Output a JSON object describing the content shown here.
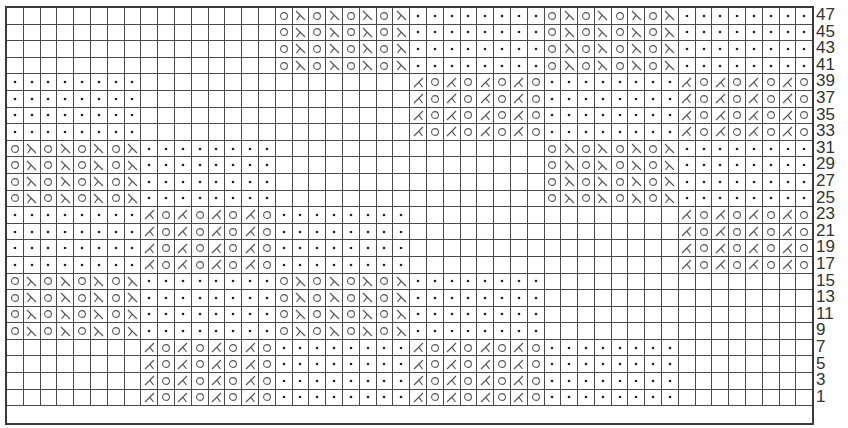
{
  "chart_title": "",
  "grid": {
    "columns": 48,
    "rows": 24,
    "block_width": 8,
    "colors": {
      "line": "#4a4a4a",
      "symbol": "#555555",
      "dot": "#222222",
      "background": "#ffffff",
      "label": "#333333"
    }
  },
  "symbols": {
    "blank": "knit (empty square)",
    "dot": "purl",
    "yo": "yarn over (circle)",
    "ssk": "left-leaning decrease",
    "k2tog": "right-leaning decrease"
  },
  "block_patterns": {
    "OS": [
      "yo",
      "ssk",
      "yo",
      "ssk",
      "yo",
      "ssk",
      "yo",
      "ssk"
    ],
    "KO": [
      "k2tog",
      "yo",
      "k2tog",
      "yo",
      "k2tog",
      "yo",
      "k2tog",
      "yo"
    ],
    "P": [
      "dot",
      "dot",
      "dot",
      "dot",
      "dot",
      "dot",
      "dot",
      "dot"
    ],
    "B": [
      "blank",
      "blank",
      "blank",
      "blank",
      "blank",
      "blank",
      "blank",
      "blank"
    ]
  },
  "bands": [
    {
      "rows": [
        "47",
        "45",
        "43",
        "41"
      ],
      "blocks": [
        "B",
        "B",
        "OS",
        "P",
        "OS",
        "P"
      ]
    },
    {
      "rows": [
        "39",
        "37",
        "35",
        "33"
      ],
      "blocks": [
        "P",
        "B",
        "B",
        "KO",
        "P",
        "KO"
      ]
    },
    {
      "rows": [
        "31",
        "29",
        "27",
        "25"
      ],
      "blocks": [
        "OS",
        "P",
        "B",
        "B",
        "OS",
        "P"
      ]
    },
    {
      "rows": [
        "23",
        "21",
        "19",
        "17"
      ],
      "blocks": [
        "P",
        "KO",
        "P",
        "B",
        "B",
        "KO"
      ]
    },
    {
      "rows": [
        "15",
        "13",
        "11",
        "9"
      ],
      "blocks": [
        "OS",
        "P",
        "OS",
        "P",
        "B",
        "B"
      ]
    },
    {
      "rows": [
        "7",
        "5",
        "3",
        "1"
      ],
      "blocks": [
        "B",
        "KO",
        "P",
        "KO",
        "P",
        "B"
      ]
    }
  ],
  "row_labels": [
    "47",
    "45",
    "43",
    "41",
    "39",
    "37",
    "35",
    "33",
    "31",
    "29",
    "27",
    "25",
    "23",
    "21",
    "19",
    "17",
    "15",
    "13",
    "11",
    "9",
    "7",
    "5",
    "3",
    "1"
  ]
}
